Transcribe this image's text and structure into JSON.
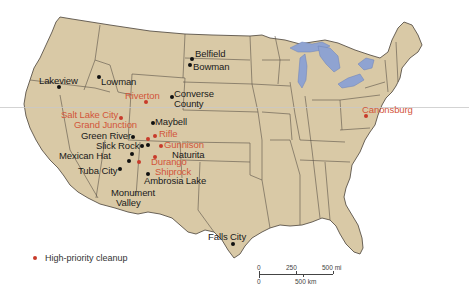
{
  "map": {
    "title": "",
    "region": "Contiguous United States",
    "colors": {
      "land": "#d9c9a6",
      "border": "#5a5248",
      "water": "#8fa3d1",
      "high_priority": "#c83a2a",
      "label_red": "#d2553a",
      "label_black": "#1a1a1a"
    },
    "sites": [
      {
        "name": "Belfield",
        "priority": false
      },
      {
        "name": "Bowman",
        "priority": false
      },
      {
        "name": "Lakeview",
        "priority": false
      },
      {
        "name": "Lowman",
        "priority": false
      },
      {
        "name": "Riverton",
        "priority": true
      },
      {
        "name": "Converse",
        "name2": "County",
        "full": "Converse County",
        "priority": false
      },
      {
        "name": "Salt Lake City",
        "priority": true
      },
      {
        "name": "Grand Junction",
        "priority": true
      },
      {
        "name": "Maybell",
        "priority": false
      },
      {
        "name": "Rifle",
        "priority": true
      },
      {
        "name": "Green River",
        "priority": false
      },
      {
        "name": "Gunnison",
        "priority": true
      },
      {
        "name": "Slick Rock",
        "priority": false
      },
      {
        "name": "Naturita",
        "priority": false
      },
      {
        "name": "Mexican Hat",
        "priority": false
      },
      {
        "name": "Durango",
        "priority": true
      },
      {
        "name": "Shiprock",
        "priority": true
      },
      {
        "name": "Tuba City",
        "priority": false
      },
      {
        "name": "Ambrosia Lake",
        "priority": false
      },
      {
        "name": "Monument",
        "name2": "Valley",
        "full": "Monument Valley",
        "priority": false
      },
      {
        "name": "Falls City",
        "priority": false
      },
      {
        "name": "Canonsburg",
        "priority": true
      }
    ]
  },
  "legend": {
    "items": [
      {
        "label": "High-priority cleanup",
        "color": "#c83a2a"
      }
    ]
  },
  "scale_bar": {
    "mi_labels": [
      "0",
      "250",
      "500 mi"
    ],
    "km_labels": [
      "0",
      "500 km"
    ]
  }
}
